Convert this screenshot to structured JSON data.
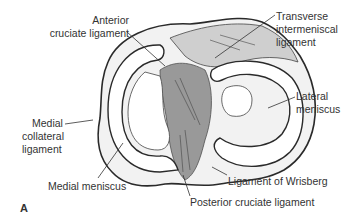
{
  "figure": {
    "panel_letter": "A",
    "labels": {
      "anterior_cruciate": [
        "Anterior",
        "cruciate ligament"
      ],
      "transverse_intermeniscal": [
        "Transverse",
        "intermeniscal",
        "ligament"
      ],
      "lateral_meniscus": [
        "Lateral",
        "meniscus"
      ],
      "medial_collateral": [
        "Medial",
        "collateral",
        "ligament"
      ],
      "medial_meniscus": "Medial meniscus",
      "ligament_wrisberg": "Ligament of Wrisberg",
      "posterior_cruciate": "Posterior cruciate ligament"
    },
    "colors": {
      "ink": "#2a2a2a",
      "background": "#ffffff",
      "shading": "#555555"
    }
  }
}
